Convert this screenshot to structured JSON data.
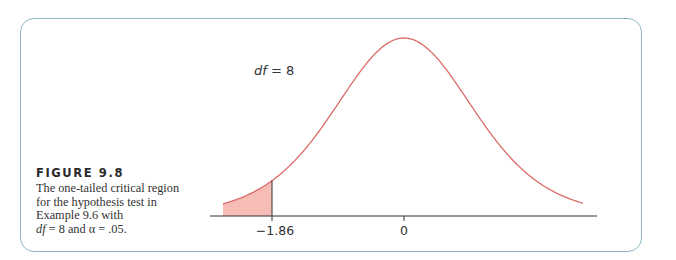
{
  "figure": {
    "title": "FIGURE 9.8",
    "caption_lines": [
      "The one-tailed critical region",
      "for the hypothesis test in",
      "Example 9.6 with"
    ],
    "caption_last": {
      "df_label": "df",
      "df_text": " = 8 and ",
      "alpha_symbol": "α",
      "alpha_text": " = .05."
    }
  },
  "chart_data": {
    "type": "area",
    "annotation": "df = 8",
    "distribution": "t",
    "df": 8,
    "alpha": 0.05,
    "tails": "one-tailed (left)",
    "critical_value": -1.86,
    "x_tick_labels": [
      "−1.86",
      "0"
    ],
    "x_ticks": [
      -1.86,
      0
    ],
    "shaded_region": {
      "from": "-inf (left tail)",
      "to": -1.86,
      "area": 0.05
    },
    "xlabel": "",
    "ylabel": "",
    "grid": false,
    "legend": null,
    "colors": {
      "curve": "#dc6b68",
      "shaded_fill": "#f5bdb6",
      "axis": "#333333",
      "border": "#8fb6c6"
    }
  },
  "labels": {
    "df_annotation_var": "df",
    "df_annotation_rest": " = 8",
    "critical_label": "−1.86",
    "zero_label": "0"
  }
}
